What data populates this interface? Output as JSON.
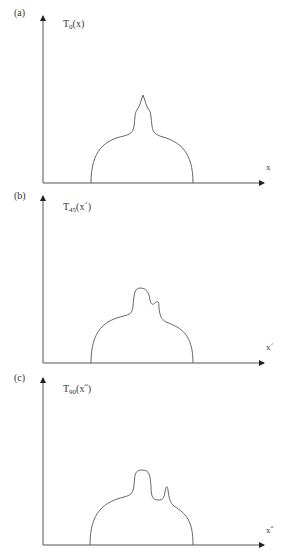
{
  "panels": [
    {
      "id": "a",
      "label": "(a)",
      "function_base": "T",
      "function_subscript": "0",
      "function_arg": "(x)",
      "axis_label": "x",
      "angle": 0
    },
    {
      "id": "b",
      "label": "(b)",
      "function_base": "T",
      "function_subscript": "45",
      "function_arg": "(x´)",
      "axis_label": "x´",
      "angle": 45
    },
    {
      "id": "c",
      "label": "(c)",
      "function_base": "T",
      "function_subscript": "90",
      "function_arg": "(x˝)",
      "axis_label": "x˝",
      "angle": 90
    }
  ],
  "colors": {
    "axis": "#555555",
    "curve": "#666666",
    "text": "#333333"
  }
}
